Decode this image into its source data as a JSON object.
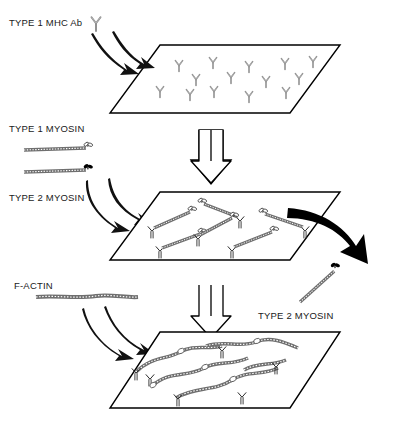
{
  "figure": {
    "type": "process-diagram",
    "stages": 3,
    "background_color": "#ffffff",
    "line_color": "#000000",
    "antibody_color": "#8a8a8a",
    "myosin_type1_head_fill": "#ffffff",
    "myosin_type2_head_fill": "#000000",
    "actin_color": "#6f6f6f"
  },
  "labels": {
    "mhc_ab": "TYPE 1 MHC Ab",
    "myosin_type1": "TYPE 1 MYOSIN",
    "myosin_type2": "TYPE 2 MYOSIN",
    "f_actin": "F-ACTIN",
    "myosin_type2_extracted": "TYPE 2 MYOSIN"
  },
  "icons": {
    "antibody": "antibody-y-icon",
    "myosin_open_head": "myosin-open-head-icon",
    "myosin_solid_head": "myosin-solid-head-icon",
    "actin_filament": "actin-filament-icon",
    "block_arrow_down": "block-arrow-down-icon",
    "curved_arrow": "curved-arrow-icon",
    "solid_extraction_arrow": "solid-arrow-icon"
  },
  "planes": [
    {
      "name": "plane-antibody-coated",
      "stage": 1,
      "contents": "TYPE 1 MHC Ab molecules bound to surface",
      "antibody_positions": [
        [
          168,
          62
        ],
        [
          205,
          60
        ],
        [
          243,
          63
        ],
        [
          186,
          77
        ],
        [
          224,
          79
        ],
        [
          152,
          88
        ],
        [
          203,
          92
        ],
        [
          262,
          76
        ],
        [
          288,
          64
        ],
        [
          282,
          92
        ],
        [
          305,
          72
        ],
        [
          262,
          95
        ],
        [
          234,
          96
        ],
        [
          175,
          96
        ]
      ]
    },
    {
      "name": "plane-myosin-bound",
      "stage": 2,
      "contents": "TYPE 1 and TYPE 2 myosin captured by antibodies; TYPE 2 myosin removed",
      "myosin_count": 6
    },
    {
      "name": "plane-actin-decorated",
      "stage": 3,
      "contents": "F-actin filaments bound to captured myosin heads",
      "myosin_count": 6,
      "actin_count": 5
    }
  ],
  "flow": [
    {
      "from": "TYPE 1 MHC Ab",
      "to": "plane-antibody-coated",
      "arrow": "curved"
    },
    {
      "from": "plane-antibody-coated",
      "to": "plane-myosin-bound",
      "arrow": "block-down"
    },
    {
      "from": "TYPE 1 MYOSIN / TYPE 2 MYOSIN",
      "to": "plane-myosin-bound",
      "arrow": "curved"
    },
    {
      "from": "plane-myosin-bound",
      "to": "TYPE 2 MYOSIN",
      "arrow": "solid-extraction"
    },
    {
      "from": "plane-myosin-bound",
      "to": "plane-actin-decorated",
      "arrow": "block-down"
    },
    {
      "from": "F-ACTIN",
      "to": "plane-actin-decorated",
      "arrow": "curved"
    }
  ]
}
